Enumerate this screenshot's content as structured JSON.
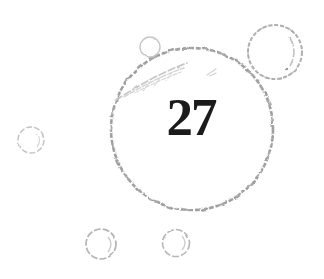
{
  "page": {
    "kind": "book-illustration",
    "chapter_number": "27",
    "colors": {
      "background": "#ffffff",
      "large_bubble_outline": "#a3a3a3",
      "large_bubble_outline_texture": "#c9c9c9",
      "medium_bubble_outline": "#ababab",
      "small_bubble_outline": "#c2c2c2",
      "highlight_stroke": "#d0d0d0",
      "number_text": "#1b1b1b"
    },
    "bubbles": {
      "count": 6,
      "large_label": "27"
    }
  }
}
